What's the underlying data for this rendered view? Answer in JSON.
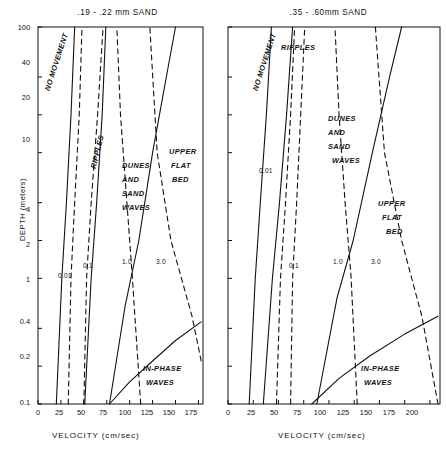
{
  "figure": {
    "axis_label_y": "DEPTH (meters)",
    "axis_label_x": "VELOCITY (cm/sec)"
  },
  "chart_data": {
    "type": "line",
    "xlabel": "VELOCITY (cm/sec)",
    "ylabel": "DEPTH (meters)",
    "grid": false,
    "legend": "none",
    "panels": [
      {
        "id": "left",
        "title": ".19 - .22 mm  SAND",
        "xlim": [
          0,
          180
        ],
        "ylim": [
          0.1,
          100
        ],
        "yscale": "log",
        "xticks": [
          0,
          25,
          50,
          75,
          100,
          125,
          150,
          175
        ],
        "xticklabels": [
          "0",
          "25",
          "50",
          "75",
          "100",
          "125",
          "150",
          "175"
        ],
        "yticks": [
          0.1,
          0.2,
          0.4,
          1,
          2,
          4,
          10,
          20,
          40,
          100
        ],
        "yticklabels": [
          "0.1",
          "0.2",
          "0.4",
          "1",
          "2",
          "4",
          "10",
          "20",
          "40",
          "100"
        ],
        "regions": [
          {
            "name": "NO MOVEMENT",
            "lines": [
              "NO MOVEMENT"
            ]
          },
          {
            "name": "RIPPLES",
            "lines": [
              "RIPPLES"
            ]
          },
          {
            "name": "DUNES AND SAND WAVES",
            "lines": [
              "DUNES",
              "AND",
              "SAND",
              "WAVES"
            ]
          },
          {
            "name": "UPPER FLAT BED",
            "lines": [
              "UPPER",
              "FLAT",
              "BED"
            ]
          },
          {
            "name": "IN-PHASE WAVES",
            "lines": [
              "IN-PHASE",
              "WAVES"
            ]
          }
        ],
        "series": [
          {
            "name": "no-movement-boundary",
            "style": "solid",
            "points": [
              [
                20,
                0.1
              ],
              [
                26,
                1
              ],
              [
                31,
                4
              ],
              [
                36,
                20
              ],
              [
                40,
                100
              ]
            ]
          },
          {
            "name": "ripples-upper-boundary",
            "style": "solid",
            "points": [
              [
                51,
                0.1
              ],
              [
                58,
                1
              ],
              [
                64,
                4
              ],
              [
                70,
                20
              ],
              [
                74,
                100
              ]
            ]
          },
          {
            "name": "dunes-upper-flat-bed-boundary",
            "style": "solid",
            "points": [
              [
                78,
                0.1
              ],
              [
                95,
                0.6
              ],
              [
                110,
                2
              ],
              [
                125,
                10
              ],
              [
                140,
                40
              ],
              [
                150,
                100
              ]
            ]
          },
          {
            "name": "in-phase-waves-boundary",
            "style": "solid",
            "points": [
              [
                78,
                0.1
              ],
              [
                100,
                0.15
              ],
              [
                125,
                0.22
              ],
              [
                150,
                0.32
              ],
              [
                178,
                0.45
              ]
            ]
          },
          {
            "name": "froude-0.01",
            "style": "dashed",
            "label": "0.01",
            "points": [
              [
                33,
                0.1
              ],
              [
                36,
                1
              ],
              [
                40,
                4
              ],
              [
                45,
                20
              ],
              [
                48,
                100
              ]
            ]
          },
          {
            "name": "froude-0.1",
            "style": "dashed",
            "label": "0.1",
            "points": [
              [
                50,
                0.1
              ],
              [
                53,
                1
              ],
              [
                58,
                4
              ],
              [
                65,
                20
              ],
              [
                71,
                100
              ]
            ]
          },
          {
            "name": "froude-1.0",
            "style": "dashed",
            "label": "1.0",
            "points": [
              [
                112,
                0.1
              ],
              [
                103,
                1
              ],
              [
                97,
                4
              ],
              [
                90,
                20
              ],
              [
                86,
                100
              ]
            ]
          },
          {
            "name": "froude-3.0",
            "style": "dashed",
            "label": "3.0",
            "points": [
              [
                178,
                0.22
              ],
              [
                168,
                0.5
              ],
              [
                145,
                2
              ],
              [
                130,
                10
              ],
              [
                122,
                100
              ]
            ]
          }
        ]
      },
      {
        "id": "right",
        "title": ".35 - .60mm SAND",
        "xlim": [
          0,
          210
        ],
        "ylim": [
          0.1,
          100
        ],
        "yscale": "log",
        "xticks": [
          0,
          25,
          50,
          75,
          100,
          125,
          150,
          175,
          200
        ],
        "xticklabels": [
          "0",
          "25",
          "50",
          "75",
          "100",
          "125",
          "150",
          "175",
          "200"
        ],
        "yticks": [
          0.1,
          0.2,
          0.4,
          1,
          2,
          4,
          10,
          20,
          40,
          100
        ],
        "yticklabels": [
          "",
          "",
          "",
          "",
          "",
          "",
          "",
          "",
          "",
          ""
        ],
        "regions": [
          {
            "name": "NO MOVEMENT",
            "lines": [
              "NO MOVEMENT"
            ]
          },
          {
            "name": "RIPPLES",
            "lines": [
              "RIPPLES"
            ]
          },
          {
            "name": "DUNES AND SAND WAVES",
            "lines": [
              "DUNES",
              "AND",
              "SAND",
              "WAVES"
            ]
          },
          {
            "name": "UPPER FLAT BED",
            "lines": [
              "UPPER",
              "FLAT",
              "BED"
            ]
          },
          {
            "name": "IN-PHASE WAVES",
            "lines": [
              "IN-PHASE",
              "WAVES"
            ]
          }
        ],
        "series": [
          {
            "name": "no-movement-boundary",
            "style": "solid",
            "points": [
              [
                21,
                0.1
              ],
              [
                27,
                1
              ],
              [
                32,
                4
              ],
              [
                38,
                20
              ],
              [
                43,
                100
              ]
            ]
          },
          {
            "name": "ripples-upper-boundary",
            "style": "solid",
            "points": [
              [
                35,
                0.1
              ],
              [
                44,
                1
              ],
              [
                51,
                4
              ],
              [
                58,
                20
              ],
              [
                64,
                100
              ]
            ]
          },
          {
            "name": "dunes-upper-flat-bed-boundary",
            "style": "solid",
            "points": [
              [
                88,
                0.1
              ],
              [
                108,
                0.7
              ],
              [
                124,
                2
              ],
              [
                143,
                10
              ],
              [
                160,
                40
              ],
              [
                172,
                100
              ]
            ]
          },
          {
            "name": "in-phase-waves-boundary",
            "style": "solid",
            "points": [
              [
                83,
                0.1
              ],
              [
                110,
                0.16
              ],
              [
                140,
                0.24
              ],
              [
                175,
                0.36
              ],
              [
                208,
                0.5
              ]
            ]
          },
          {
            "name": "froude-0.01",
            "style": "dashed",
            "label": "0.01",
            "points": [
              [
                48,
                0.1
              ],
              [
                52,
                1
              ],
              [
                57,
                4
              ],
              [
                62,
                20
              ],
              [
                66,
                100
              ]
            ]
          },
          {
            "name": "froude-0.1",
            "style": "dashed",
            "label": "0.1",
            "points": [
              [
                62,
                0.1
              ],
              [
                64,
                1
              ],
              [
                68,
                4
              ],
              [
                72,
                20
              ],
              [
                76,
                100
              ]
            ]
          },
          {
            "name": "froude-1.0",
            "style": "dashed",
            "label": "1.0",
            "points": [
              [
                128,
                0.1
              ],
              [
                122,
                1
              ],
              [
                116,
                4
              ],
              [
                110,
                20
              ],
              [
                106,
                100
              ]
            ]
          },
          {
            "name": "froude-3.0",
            "style": "dashed",
            "label": "3.0",
            "points": [
              [
                208,
                0.1
              ],
              [
                192,
                0.5
              ],
              [
                172,
                2
              ],
              [
                155,
                10
              ],
              [
                146,
                100
              ]
            ]
          }
        ]
      }
    ]
  }
}
